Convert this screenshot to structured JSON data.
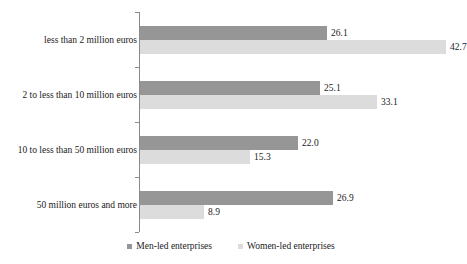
{
  "chart_data": {
    "type": "bar",
    "orientation": "horizontal",
    "title": "",
    "subtitle": "",
    "xlabel": "",
    "ylabel": "",
    "xlim": [
      0,
      42.7
    ],
    "grid": false,
    "legend_position": "bottom",
    "categories": [
      "less than 2 million euros",
      "2 to less than 10 million euros",
      "10 to less than 50 million euros",
      "50 million euros and more"
    ],
    "series": [
      {
        "name": "Men-led enterprises",
        "color": "#969696",
        "values": [
          26.1,
          25.1,
          22.0,
          26.9
        ],
        "labels": [
          "26.1",
          "25.1",
          "22.0",
          "26.9"
        ]
      },
      {
        "name": "Women-led enterprises",
        "color": "#dcdcdc",
        "values": [
          42.7,
          33.1,
          15.3,
          8.9
        ],
        "labels": [
          "42.7",
          "33.1",
          "15.3",
          "8.9"
        ]
      }
    ]
  },
  "legend": {
    "items": [
      {
        "label": "Men-led enterprises",
        "color": "#969696"
      },
      {
        "label": "Women-led enterprises",
        "color": "#dcdcdc"
      }
    ]
  },
  "axis": {
    "line_color": "#8a8a8a"
  }
}
